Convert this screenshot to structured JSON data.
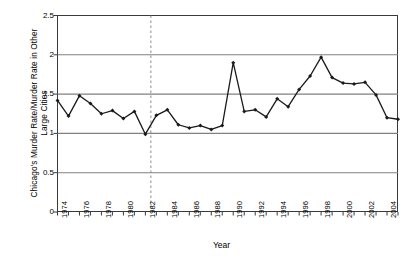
{
  "chart_data": {
    "type": "line",
    "title": "",
    "xlabel": "Year",
    "ylabel": "Chicago's Murder Rate/Murder Rate in Other Large Cities",
    "ylim": [
      0,
      2.5
    ],
    "xlim": [
      1974,
      2005
    ],
    "ytick_labels": [
      "0",
      "0.5",
      "1",
      "1.5",
      "2",
      "2.5"
    ],
    "ytick_values": [
      0,
      0.5,
      1,
      1.5,
      2,
      2.5
    ],
    "xtick_labels": [
      "1974",
      "1976",
      "1978",
      "1980",
      "1982",
      "1984",
      "1986",
      "1988",
      "1990",
      "1992",
      "1994",
      "1996",
      "1998",
      "2000",
      "2002",
      "2004"
    ],
    "xtick_values": [
      1974,
      1976,
      1978,
      1980,
      1982,
      1984,
      1986,
      1988,
      1990,
      1992,
      1994,
      1996,
      1998,
      2000,
      2002,
      2004
    ],
    "grid": "horizontal",
    "legend": "none",
    "marker": "diamond",
    "line_color": "#1a1a1a",
    "grid_color": "#808080",
    "axis_color": "#3a3a3a",
    "x": [
      1974,
      1975,
      1976,
      1977,
      1978,
      1979,
      1980,
      1981,
      1982,
      1983,
      1984,
      1985,
      1986,
      1987,
      1988,
      1989,
      1990,
      1991,
      1992,
      1993,
      1994,
      1995,
      1996,
      1997,
      1998,
      1999,
      2000,
      2001,
      2002,
      2003,
      2004,
      2005
    ],
    "values": [
      1.42,
      1.22,
      1.48,
      1.38,
      1.25,
      1.29,
      1.19,
      1.28,
      0.99,
      1.23,
      1.3,
      1.11,
      1.07,
      1.1,
      1.05,
      1.1,
      1.9,
      1.28,
      1.3,
      1.21,
      1.44,
      1.34,
      1.56,
      1.73,
      1.97,
      1.71,
      1.64,
      1.63,
      1.65,
      1.49,
      1.2,
      1.18
    ],
    "annotations": [
      {
        "name": "reference-line",
        "type": "vertical-dashed-line",
        "x": 1982.5,
        "color": "#8c8c8c"
      }
    ]
  }
}
